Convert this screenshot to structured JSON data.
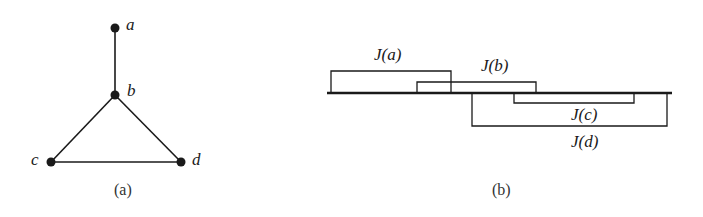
{
  "panels": {
    "a": {
      "caption": "(a)",
      "nodes": [
        {
          "id": "a",
          "label": "a",
          "x": 115,
          "y": 28
        },
        {
          "id": "b",
          "label": "b",
          "x": 115,
          "y": 95
        },
        {
          "id": "c",
          "label": "c",
          "x": 51,
          "y": 162
        },
        {
          "id": "d",
          "label": "d",
          "x": 181,
          "y": 162
        }
      ],
      "edges": [
        {
          "from": "a",
          "to": "b"
        },
        {
          "from": "b",
          "to": "c"
        },
        {
          "from": "b",
          "to": "d"
        },
        {
          "from": "c",
          "to": "d"
        }
      ]
    },
    "b": {
      "caption": "(b)",
      "baseline": {
        "x1": 327,
        "x2": 672,
        "y": 93
      },
      "intervals": [
        {
          "id": "a",
          "label": "J(a)",
          "side": "above",
          "x1": 331,
          "x2": 451,
          "y": 71
        },
        {
          "id": "b",
          "label": "J(b)",
          "side": "above",
          "x1": 417,
          "x2": 536,
          "y": 82
        },
        {
          "id": "c",
          "label": "J(c)",
          "side": "below",
          "x1": 514,
          "x2": 634,
          "y": 103
        },
        {
          "id": "d",
          "label": "J(d)",
          "side": "below",
          "x1": 472,
          "x2": 667,
          "y": 126
        }
      ]
    }
  },
  "colors": {
    "ink": "#1a1a1a",
    "background": "#ffffff"
  }
}
